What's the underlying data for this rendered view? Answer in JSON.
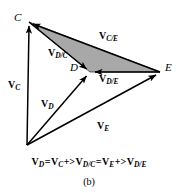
{
  "figure": {
    "caption": "(b)",
    "background_color": "#ffffff",
    "stroke_color": "#000000",
    "shaded_region_color": "#a8a8a8",
    "points": [
      {
        "id": "C",
        "label": "C",
        "x": 29,
        "y": 22
      },
      {
        "id": "D",
        "label": "D",
        "x": 90,
        "y": 72
      },
      {
        "id": "E",
        "label": "E",
        "x": 160,
        "y": 72
      },
      {
        "id": "O",
        "label": "",
        "x": 27,
        "y": 145
      }
    ],
    "vectors": [
      {
        "id": "V_C",
        "symbol": "V",
        "subscript": "C",
        "from": "O",
        "to": "C"
      },
      {
        "id": "V_D",
        "symbol": "V",
        "subscript": "D",
        "from": "O",
        "to": "D"
      },
      {
        "id": "V_E",
        "symbol": "V",
        "subscript": "E",
        "from": "O",
        "to": "E"
      },
      {
        "id": "V_D/C",
        "symbol": "V",
        "subscript": "D/C",
        "from": "C",
        "to": "D"
      },
      {
        "id": "V_D/E",
        "symbol": "V",
        "subscript": "D/E",
        "from": "E",
        "to": "D"
      },
      {
        "id": "V_C/E",
        "symbol": "V",
        "subscript": "C/E",
        "from": "E",
        "to": "C"
      }
    ],
    "shaded_triangle": [
      "C",
      "D",
      "E"
    ],
    "equation": {
      "terms": [
        {
          "symbol": "V",
          "subscript": "D"
        },
        {
          "symbol": "V",
          "subscript": "C"
        },
        {
          "symbol": "V",
          "subscript": "D/C"
        },
        {
          "symbol": "V",
          "subscript": "E"
        },
        {
          "symbol": "V",
          "subscript": "D/E"
        }
      ],
      "equals": "=",
      "operator": "+>",
      "text": "V_D = V_C +> V_D/C = V_E +> V_D/E"
    }
  }
}
